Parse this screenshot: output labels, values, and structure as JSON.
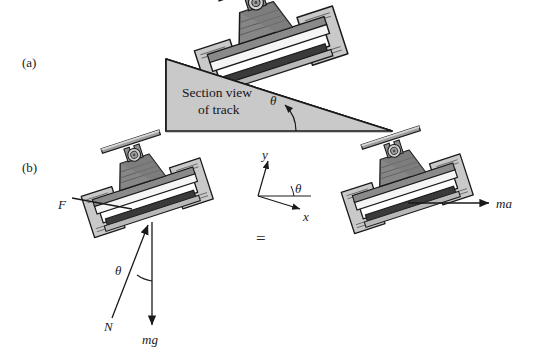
{
  "figure": {
    "background_color": "#ffffff",
    "ink_color": "#1a1a1a"
  },
  "panels": [
    {
      "id": "a",
      "label": "(a)",
      "x": 22,
      "y": 67
    },
    {
      "id": "b",
      "label": "(b)",
      "x": 22,
      "y": 172
    }
  ],
  "panel_a": {
    "track_label_line1": "Section view",
    "track_label_line2": "of track",
    "angle_label": "θ",
    "ramp": {
      "fill": "#c9c9c9",
      "stroke": "#1a1a1a",
      "left_top_x": 166,
      "left_top_y": 59,
      "left_bottom_x": 166,
      "left_bottom_y": 131,
      "right_bottom_x": 392,
      "right_bottom_y": 131
    }
  },
  "panel_b": {
    "equals_sign": "=",
    "force_labels": {
      "applied": "F",
      "normal": "N",
      "weight": "mg",
      "inertia": "ma",
      "angle": "θ"
    },
    "axes": {
      "y_label": "y",
      "x_label": "x",
      "angle_label": "θ"
    }
  },
  "colors": {
    "ramp_fill": "#c9c9c9",
    "body_dark": "#7d7d7d",
    "body_mid": "#9a9a9a",
    "body_light": "#c4c4c4",
    "bracket_fill": "#c9c9c9",
    "rail_white": "#f5f5f5",
    "rail_black": "#3a3a3a",
    "outline": "#1a1a1a"
  },
  "geometry": {
    "incline_angle_deg": 18,
    "vehicle_a": {
      "cx": 272,
      "cy": 55,
      "rotation_deg": -18
    },
    "vehicle_b_left": {
      "cx": 148,
      "cy": 200,
      "rotation_deg": -18
    },
    "vehicle_b_right": {
      "cx": 410,
      "cy": 195,
      "rotation_deg": -18
    }
  }
}
